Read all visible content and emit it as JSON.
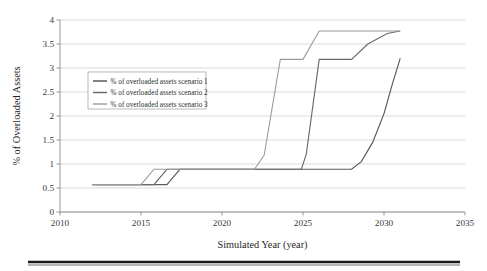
{
  "chart_data": {
    "type": "line",
    "title": "",
    "xlabel": "Simulated Year (year)",
    "ylabel": "% of Overloaded Assets",
    "xlim": [
      2010,
      2035
    ],
    "ylim": [
      0,
      4
    ],
    "xticks": [
      2010,
      2015,
      2020,
      2025,
      2030,
      2035
    ],
    "xtick_labels": [
      "2010",
      "2015",
      "2020",
      "2025",
      "2030",
      "2035"
    ],
    "yticks": [
      0,
      0.5,
      1,
      1.5,
      2,
      2.5,
      3,
      3.5,
      4
    ],
    "ytick_labels": [
      "0",
      "0.5",
      "1",
      "1.5",
      "2",
      "2.5",
      "3",
      "3.5",
      "4"
    ],
    "grid": "horizontal",
    "legend_position": "upper-left-inside",
    "series": [
      {
        "name": "% of overloaded assets scenario 1",
        "color": "#595959",
        "width": 1.15,
        "points": [
          [
            2012.0,
            0.57
          ],
          [
            2016.6,
            0.57
          ],
          [
            2017.4,
            0.89
          ],
          [
            2028.0,
            0.89
          ],
          [
            2028.6,
            1.05
          ],
          [
            2029.3,
            1.45
          ],
          [
            2030.0,
            2.05
          ],
          [
            2030.5,
            2.65
          ],
          [
            2031.0,
            3.2
          ]
        ]
      },
      {
        "name": "% of overloaded assets scenario 2",
        "color": "#6b6b6b",
        "width": 1.15,
        "points": [
          [
            2012.0,
            0.57
          ],
          [
            2015.8,
            0.57
          ],
          [
            2016.6,
            0.89
          ],
          [
            2024.9,
            0.89
          ],
          [
            2025.2,
            1.2
          ],
          [
            2026.0,
            3.18
          ],
          [
            2028.0,
            3.18
          ],
          [
            2029.0,
            3.5
          ],
          [
            2030.2,
            3.72
          ],
          [
            2031.0,
            3.77
          ]
        ]
      },
      {
        "name": "% of overloaded assets scenario 3",
        "color": "#9a9a9a",
        "width": 1.05,
        "points": [
          [
            2012.0,
            0.57
          ],
          [
            2015.0,
            0.57
          ],
          [
            2015.8,
            0.89
          ],
          [
            2022.0,
            0.89
          ],
          [
            2022.6,
            1.18
          ],
          [
            2023.6,
            3.18
          ],
          [
            2025.0,
            3.18
          ],
          [
            2026.0,
            3.77
          ],
          [
            2031.0,
            3.77
          ]
        ]
      }
    ]
  },
  "legend": {
    "entries": [
      "% of overloaded assets scenario 1",
      "% of overloaded assets scenario 2",
      "% of overloaded assets scenario 3"
    ]
  }
}
